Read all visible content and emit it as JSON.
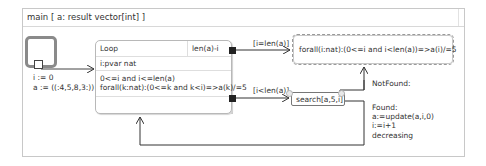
{
  "frame": {
    "title": "main [ a: result vector[int] ]"
  },
  "initial_state": {
    "assignments": [
      "i := 0",
      "a := ((:4,5,8,3:))"
    ]
  },
  "loop": {
    "title": "Loop",
    "variant": "len(a)-i",
    "variables": "i:pvar nat",
    "invariants": [
      "0<=i and i<=len(a)",
      "forall(k:nat):(0<=k and k<i)=>a(k)/=5"
    ]
  },
  "transitions": {
    "exit_guard": "[i=len(a)]",
    "continue_guard": "[i<len(a)]",
    "not_found_label": "NotFound:",
    "found_block": [
      "Found:",
      "a:=update(a,i,0)",
      "i:=i+1",
      "decreasing"
    ]
  },
  "postcondition": {
    "text": "forall(i:nat):(0<=i and i<len(a))=>a(i)/=5"
  },
  "call": {
    "text": "search[a,5,i]"
  },
  "colors": {
    "frame_border": "#c8c8c8",
    "connector": "#222222",
    "arrow": "#333333",
    "initial_border": "#8a8a8a"
  }
}
